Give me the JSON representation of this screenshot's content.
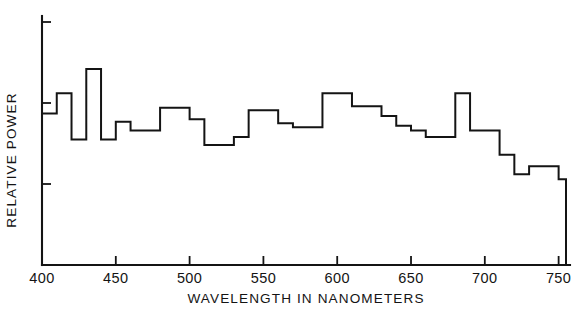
{
  "chart_data": {
    "type": "bar",
    "render_style": "step-histogram",
    "title": "",
    "subtitle": "",
    "xlabel": "WAVELENGTH IN NANOMETERS",
    "ylabel": "RELATIVE POWER",
    "xlim": [
      400,
      755
    ],
    "ylim": [
      0,
      3
    ],
    "grid": false,
    "legend": null,
    "legend_position": "none",
    "x_tick_labels": [
      "400",
      "450",
      "500",
      "550",
      "600",
      "650",
      "700",
      "750"
    ],
    "x_ticks": [
      400,
      450,
      500,
      550,
      600,
      650,
      700,
      750
    ],
    "y_ticks": [
      0,
      1,
      2,
      3
    ],
    "y_tick_labels": [
      "",
      "",
      "",
      ""
    ],
    "bin_width_nm": 10,
    "x_bin_starts": [
      400,
      410,
      420,
      430,
      440,
      450,
      460,
      470,
      480,
      490,
      500,
      510,
      520,
      530,
      540,
      550,
      560,
      570,
      580,
      590,
      600,
      610,
      620,
      630,
      640,
      650,
      660,
      670,
      680,
      690,
      700,
      710,
      720,
      730,
      740,
      750
    ],
    "categories": [
      "400-410",
      "410-420",
      "420-430",
      "430-440",
      "440-450",
      "450-460",
      "460-470",
      "470-480",
      "480-490",
      "490-500",
      "500-510",
      "510-520",
      "520-530",
      "530-540",
      "540-550",
      "550-560",
      "560-570",
      "570-580",
      "580-590",
      "590-600",
      "600-610",
      "610-620",
      "620-630",
      "630-640",
      "640-650",
      "650-660",
      "660-670",
      "670-680",
      "680-690",
      "690-700",
      "700-710",
      "710-720",
      "720-730",
      "730-740",
      "740-750",
      "750-755"
    ],
    "values": [
      1.87,
      2.12,
      1.55,
      2.42,
      1.55,
      1.77,
      1.66,
      1.66,
      1.94,
      1.94,
      1.8,
      1.48,
      1.48,
      1.58,
      1.91,
      1.91,
      1.75,
      1.7,
      1.7,
      2.12,
      2.12,
      1.96,
      1.96,
      1.84,
      1.72,
      1.66,
      1.58,
      1.58,
      2.12,
      1.66,
      1.66,
      1.36,
      1.12,
      1.22,
      1.22,
      1.06
    ],
    "values_note": "Relative power, estimated from gridline spacing; y-axis is unlabeled with ticks at 0, 1, 2, 3",
    "series": [
      {
        "name": "Relative power spectrum",
        "values": [
          1.87,
          2.12,
          1.55,
          2.42,
          1.55,
          1.77,
          1.66,
          1.66,
          1.94,
          1.94,
          1.8,
          1.48,
          1.48,
          1.58,
          1.91,
          1.91,
          1.75,
          1.7,
          1.7,
          2.12,
          2.12,
          1.96,
          1.96,
          1.84,
          1.72,
          1.66,
          1.58,
          1.58,
          2.12,
          1.66,
          1.66,
          1.36,
          1.12,
          1.22,
          1.22,
          1.06
        ]
      }
    ],
    "colors": {
      "line": "#141414",
      "axis": "#141414",
      "background": "#ffffff"
    }
  },
  "axes": {
    "x_title": "WAVELENGTH IN NANOMETERS",
    "y_title": "RELATIVE POWER",
    "x_tick_labels": [
      "400",
      "450",
      "500",
      "550",
      "600",
      "650",
      "700",
      "750"
    ]
  }
}
